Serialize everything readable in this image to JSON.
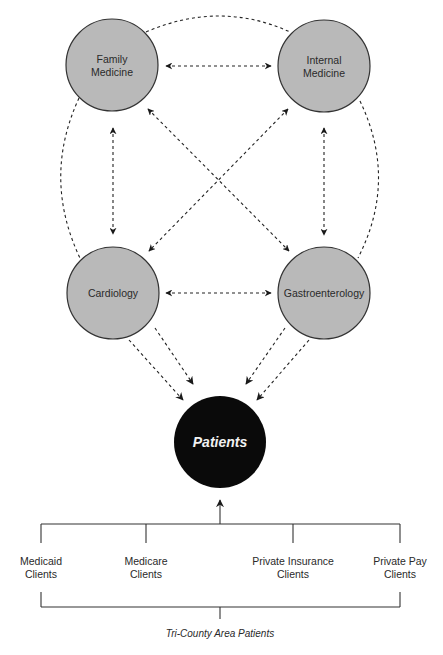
{
  "diagram": {
    "colors": {
      "specialty_fill": "#b9b9b9",
      "specialty_stroke": "#333333",
      "patients_fill": "#0a0a0a",
      "patients_text": "#f2f2f2",
      "line": "#222222",
      "background": "#ffffff"
    },
    "specialties": [
      {
        "id": "family-medicine",
        "line1": "Family",
        "line2": "Medicine",
        "cx": 112,
        "cy": 65
      },
      {
        "id": "internal-medicine",
        "line1": "Internal",
        "line2": "Medicine",
        "cx": 324,
        "cy": 66
      },
      {
        "id": "cardiology",
        "line1": "Cardiology",
        "line2": "",
        "cx": 113,
        "cy": 293
      },
      {
        "id": "gastroenterology",
        "line1": "Gastroenterology",
        "line2": "",
        "cx": 324,
        "cy": 293
      }
    ],
    "center_node": {
      "label": "Patients",
      "cx": 220,
      "cy": 442
    },
    "client_groups": [
      {
        "line1": "Medicaid",
        "line2": "Clients"
      },
      {
        "line1": "Medicare",
        "line2": "Clients"
      },
      {
        "line1": "Private Insurance",
        "line2": "Clients"
      },
      {
        "line1": "Private Pay",
        "line2": "Clients"
      }
    ],
    "area_label": "Tri-County Area Patients",
    "connections": [
      {
        "from": "Family Medicine",
        "to": "Internal Medicine",
        "type": "bidirectional-dashed"
      },
      {
        "from": "Cardiology",
        "to": "Gastroenterology",
        "type": "bidirectional-dashed"
      },
      {
        "from": "Family Medicine",
        "to": "Cardiology",
        "type": "bidirectional-dashed"
      },
      {
        "from": "Internal Medicine",
        "to": "Gastroenterology",
        "type": "bidirectional-dashed"
      },
      {
        "from": "Family Medicine",
        "to": "Gastroenterology",
        "type": "bidirectional-dashed"
      },
      {
        "from": "Internal Medicine",
        "to": "Cardiology",
        "type": "bidirectional-dashed"
      },
      {
        "from": "Cardiology",
        "to": "Patients",
        "type": "dashed-arrow-x2"
      },
      {
        "from": "Gastroenterology",
        "to": "Patients",
        "type": "dashed-arrow-x2"
      },
      {
        "from": "Client groups",
        "to": "Patients",
        "type": "solid-arrow"
      }
    ]
  }
}
